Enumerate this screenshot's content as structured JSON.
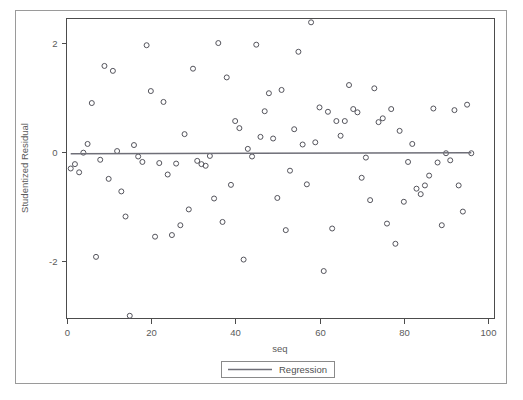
{
  "window": {
    "clipped_title": "",
    "frame_color": "#9a9a9a",
    "background": "#ffffff"
  },
  "chart_data": {
    "type": "scatter",
    "title": "",
    "xlabel": "seq",
    "ylabel": "Studentized Residual",
    "xlim": [
      0,
      101.5
    ],
    "ylim": [
      -3.05,
      2.45
    ],
    "xticks": [
      0,
      20,
      40,
      60,
      80,
      100
    ],
    "xticklabels": [
      "0",
      "20",
      "40",
      "60",
      "80",
      "100"
    ],
    "yticks": [
      2,
      0,
      -2
    ],
    "yticklabels": [
      "2",
      "0",
      "-2"
    ],
    "grid": false,
    "legend_position": "below-axis-center",
    "marker_style": "open-circle",
    "marker_color": "#54545c",
    "line_color": "#6f6f78",
    "legend": [
      {
        "label": "Regression",
        "type": "line",
        "color": "#6f6f78"
      }
    ],
    "series": [
      {
        "name": "Studentized Residual",
        "type": "scatter",
        "points": [
          [
            1,
            -0.3
          ],
          [
            2,
            -0.22
          ],
          [
            3,
            -0.37
          ],
          [
            4,
            -0.01
          ],
          [
            5,
            0.15
          ],
          [
            6,
            0.9
          ],
          [
            7,
            -1.92
          ],
          [
            8,
            -0.14
          ],
          [
            9,
            1.58
          ],
          [
            10,
            -0.49
          ],
          [
            11,
            1.49
          ],
          [
            12,
            0.02
          ],
          [
            13,
            -0.72
          ],
          [
            14,
            -1.18
          ],
          [
            15,
            -3.0
          ],
          [
            16,
            0.13
          ],
          [
            17,
            -0.08
          ],
          [
            18,
            -0.18
          ],
          [
            19,
            1.96
          ],
          [
            20,
            1.12
          ],
          [
            21,
            -1.55
          ],
          [
            22,
            -0.2
          ],
          [
            23,
            0.92
          ],
          [
            24,
            -0.41
          ],
          [
            25,
            -1.52
          ],
          [
            26,
            -0.21
          ],
          [
            27,
            -1.34
          ],
          [
            28,
            0.33
          ],
          [
            29,
            -1.05
          ],
          [
            30,
            1.53
          ],
          [
            31,
            -0.16
          ],
          [
            32,
            -0.22
          ],
          [
            33,
            -0.25
          ],
          [
            34,
            -0.07
          ],
          [
            35,
            -0.85
          ],
          [
            36,
            2.0
          ],
          [
            37,
            -1.28
          ],
          [
            38,
            1.37
          ],
          [
            39,
            -0.6
          ],
          [
            40,
            0.57
          ],
          [
            41,
            0.44
          ],
          [
            42,
            -1.97
          ],
          [
            43,
            0.06
          ],
          [
            44,
            -0.08
          ],
          [
            45,
            1.97
          ],
          [
            46,
            0.28
          ],
          [
            47,
            0.75
          ],
          [
            48,
            1.08
          ],
          [
            49,
            0.25
          ],
          [
            50,
            -0.84
          ],
          [
            51,
            1.14
          ],
          [
            52,
            -1.43
          ],
          [
            53,
            -0.34
          ],
          [
            54,
            0.42
          ],
          [
            55,
            1.84
          ],
          [
            56,
            0.14
          ],
          [
            57,
            -0.59
          ],
          [
            58,
            2.38
          ],
          [
            59,
            0.18
          ],
          [
            60,
            0.82
          ],
          [
            61,
            -2.18
          ],
          [
            62,
            0.74
          ],
          [
            63,
            -1.4
          ],
          [
            64,
            0.57
          ],
          [
            65,
            0.3
          ],
          [
            66,
            0.57
          ],
          [
            67,
            1.23
          ],
          [
            68,
            0.79
          ],
          [
            69,
            0.73
          ],
          [
            70,
            -0.47
          ],
          [
            71,
            -0.1
          ],
          [
            72,
            -0.88
          ],
          [
            73,
            1.17
          ],
          [
            74,
            0.55
          ],
          [
            75,
            0.62
          ],
          [
            76,
            -1.31
          ],
          [
            77,
            0.79
          ],
          [
            78,
            -1.68
          ],
          [
            79,
            0.39
          ],
          [
            80,
            -0.91
          ],
          [
            81,
            -0.18
          ],
          [
            82,
            0.15
          ],
          [
            83,
            -0.67
          ],
          [
            84,
            -0.77
          ],
          [
            85,
            -0.61
          ],
          [
            86,
            -0.43
          ],
          [
            87,
            0.8
          ],
          [
            88,
            -0.19
          ],
          [
            89,
            -1.34
          ],
          [
            90,
            -0.02
          ],
          [
            91,
            -0.15
          ],
          [
            92,
            0.77
          ],
          [
            93,
            -0.61
          ],
          [
            94,
            -1.09
          ],
          [
            95,
            0.87
          ],
          [
            96,
            -0.02
          ]
        ]
      },
      {
        "name": "Regression",
        "type": "line",
        "points": [
          [
            1,
            -0.03
          ],
          [
            96,
            -0.01
          ]
        ]
      }
    ]
  }
}
